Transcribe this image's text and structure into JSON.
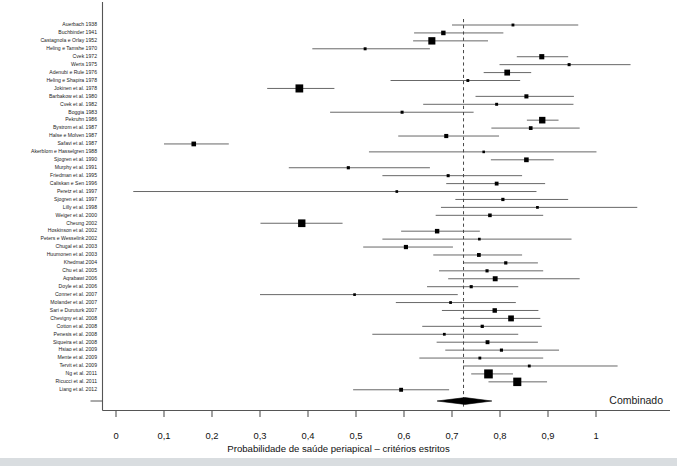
{
  "figure": {
    "type": "forest-plot",
    "axis_title": "Probabilidade de saúde periapical – critérios estritos",
    "combined_label": "Combinado",
    "colors": {
      "marker": "#000000",
      "line": "#4d4d4d",
      "axis": "#555555",
      "reference_line": "#333333",
      "text": "#1b1b1b",
      "background": "#ffffff",
      "page_band": "#d9dde0"
    }
  },
  "chart_data": {
    "type": "forest",
    "title": "",
    "xlabel": "Probabilidade de saúde periapical – critérios estritos",
    "ylabel": "",
    "xlim": [
      0,
      1.12
    ],
    "xticks": [
      0,
      0.1,
      0.2,
      0.3,
      0.4,
      0.5,
      0.6,
      0.7,
      0.8,
      0.9,
      1
    ],
    "xticklabels": [
      "0",
      "0,1",
      "0,2",
      "0,3",
      "0,4",
      "0,5",
      "0,6",
      "0,7",
      "0,8",
      "0,9",
      "1"
    ],
    "grid": false,
    "legend": false,
    "reference_line": 0.724,
    "effect_measure": "Probabilidade de saúde periapical",
    "summary": {
      "label": "Combinado",
      "estimate": 0.727,
      "ci_low": 0.669,
      "ci_high": 0.783,
      "shape": "diamond"
    },
    "studies": [
      {
        "label": "Auerbach 1938",
        "estimate": 0.827,
        "ci_low": 0.7,
        "ci_high": 0.963,
        "weight": 0.09
      },
      {
        "label": "Buchbinder 1941",
        "estimate": 0.682,
        "ci_low": 0.621,
        "ci_high": 0.807,
        "weight": 0.26
      },
      {
        "label": "Castagnola e Orlay 1952",
        "estimate": 0.658,
        "ci_low": 0.619,
        "ci_high": 0.775,
        "weight": 0.55
      },
      {
        "label": "Heling e Tamshe 1970",
        "estimate": 0.519,
        "ci_low": 0.409,
        "ci_high": 0.654,
        "weight": 0.1
      },
      {
        "label": "Cvek 1972",
        "estimate": 0.887,
        "ci_low": 0.835,
        "ci_high": 0.942,
        "weight": 0.33
      },
      {
        "label": "Werts 1975",
        "estimate": 0.944,
        "ci_low": 0.799,
        "ci_high": 1.072,
        "weight": 0.11
      },
      {
        "label": "Adenubi e Rule 1976",
        "estimate": 0.815,
        "ci_low": 0.766,
        "ci_high": 0.865,
        "weight": 0.4
      },
      {
        "label": "Heling e Shapira 1978",
        "estimate": 0.733,
        "ci_low": 0.572,
        "ci_high": 0.842,
        "weight": 0.09
      },
      {
        "label": "Jokinen et al. 1978",
        "estimate": 0.382,
        "ci_low": 0.315,
        "ci_high": 0.455,
        "weight": 0.62
      },
      {
        "label": "Barbakow et al. 1980",
        "estimate": 0.855,
        "ci_low": 0.749,
        "ci_high": 0.954,
        "weight": 0.22
      },
      {
        "label": "Cvek et al. 1982",
        "estimate": 0.793,
        "ci_low": 0.64,
        "ci_high": 0.953,
        "weight": 0.1
      },
      {
        "label": "Boggia 1983",
        "estimate": 0.596,
        "ci_low": 0.446,
        "ci_high": 0.745,
        "weight": 0.11
      },
      {
        "label": "Pekruhn 1986",
        "estimate": 0.888,
        "ci_low": 0.856,
        "ci_high": 0.922,
        "weight": 0.47
      },
      {
        "label": "Bystrom et al. 1987",
        "estimate": 0.864,
        "ci_low": 0.782,
        "ci_high": 0.966,
        "weight": 0.18
      },
      {
        "label": "Halse e Molven 1987",
        "estimate": 0.688,
        "ci_low": 0.588,
        "ci_high": 0.798,
        "weight": 0.22
      },
      {
        "label": "Safavi et al. 1987",
        "estimate": 0.162,
        "ci_low": 0.1,
        "ci_high": 0.235,
        "weight": 0.28
      },
      {
        "label": "Akerblom e Hasselgren 1988",
        "estimate": 0.766,
        "ci_low": 0.527,
        "ci_high": 1.001,
        "weight": 0.06
      },
      {
        "label": "Sjogren et al. 1990",
        "estimate": 0.855,
        "ci_low": 0.781,
        "ci_high": 0.912,
        "weight": 0.28
      },
      {
        "label": "Murphy et al. 1991",
        "estimate": 0.484,
        "ci_low": 0.36,
        "ci_high": 0.654,
        "weight": 0.12
      },
      {
        "label": "Friedman et al. 1995",
        "estimate": 0.692,
        "ci_low": 0.555,
        "ci_high": 0.846,
        "weight": 0.11
      },
      {
        "label": "Caliskan e Sen 1996",
        "estimate": 0.793,
        "ci_low": 0.688,
        "ci_high": 0.894,
        "weight": 0.19
      },
      {
        "label": "Peretz et al. 1997",
        "estimate": 0.585,
        "ci_low": 0.036,
        "ci_high": 0.876,
        "weight": 0.07
      },
      {
        "label": "Sjogren et al. 1997",
        "estimate": 0.806,
        "ci_low": 0.707,
        "ci_high": 0.942,
        "weight": 0.13
      },
      {
        "label": "Lilly et al. 1998",
        "estimate": 0.878,
        "ci_low": 0.677,
        "ci_high": 1.086,
        "weight": 0.08
      },
      {
        "label": "Weiger et al. 2000",
        "estimate": 0.779,
        "ci_low": 0.666,
        "ci_high": 0.89,
        "weight": 0.17
      },
      {
        "label": "Cheung 2002",
        "estimate": 0.387,
        "ci_low": 0.301,
        "ci_high": 0.472,
        "weight": 0.58
      },
      {
        "label": "Hoskinson et al. 2002",
        "estimate": 0.669,
        "ci_low": 0.594,
        "ci_high": 0.758,
        "weight": 0.26
      },
      {
        "label": "Peters e Wesselink 2002",
        "estimate": 0.757,
        "ci_low": 0.555,
        "ci_high": 0.949,
        "weight": 0.07
      },
      {
        "label": "Chugal et al. 2003",
        "estimate": 0.604,
        "ci_low": 0.515,
        "ci_high": 0.702,
        "weight": 0.23
      },
      {
        "label": "Huumonen et al. 2003",
        "estimate": 0.756,
        "ci_low": 0.661,
        "ci_high": 0.846,
        "weight": 0.19
      },
      {
        "label": "Khedmat 2004",
        "estimate": 0.812,
        "ci_low": 0.725,
        "ci_high": 0.879,
        "weight": 0.13
      },
      {
        "label": "Chu et al. 2005",
        "estimate": 0.773,
        "ci_low": 0.673,
        "ci_high": 0.89,
        "weight": 0.12
      },
      {
        "label": "Aqrabawi 2006",
        "estimate": 0.79,
        "ci_low": 0.692,
        "ci_high": 0.966,
        "weight": 0.31
      },
      {
        "label": "Doyle et al. 2006",
        "estimate": 0.74,
        "ci_low": 0.648,
        "ci_high": 0.838,
        "weight": 0.12
      },
      {
        "label": "Conner et al. 2007",
        "estimate": 0.497,
        "ci_low": 0.3,
        "ci_high": 0.712,
        "weight": 0.07
      },
      {
        "label": "Molander et al. 2007",
        "estimate": 0.697,
        "ci_low": 0.583,
        "ci_high": 0.833,
        "weight": 0.08
      },
      {
        "label": "Sari e Duruturk 2007",
        "estimate": 0.789,
        "ci_low": 0.679,
        "ci_high": 0.88,
        "weight": 0.26
      },
      {
        "label": "Chevigny et al. 2008",
        "estimate": 0.823,
        "ci_low": 0.718,
        "ci_high": 0.884,
        "weight": 0.4
      },
      {
        "label": "Cotton et al. 2008",
        "estimate": 0.763,
        "ci_low": 0.638,
        "ci_high": 0.887,
        "weight": 0.13
      },
      {
        "label": "Penesis et al. 2008",
        "estimate": 0.684,
        "ci_low": 0.534,
        "ci_high": 0.838,
        "weight": 0.08
      },
      {
        "label": "Siqueira et al. 2008",
        "estimate": 0.774,
        "ci_low": 0.668,
        "ci_high": 0.879,
        "weight": 0.2
      },
      {
        "label": "Hsiao et al. 2009",
        "estimate": 0.803,
        "ci_low": 0.686,
        "ci_high": 0.923,
        "weight": 0.12
      },
      {
        "label": "Mente et al. 2009",
        "estimate": 0.758,
        "ci_low": 0.632,
        "ci_high": 0.89,
        "weight": 0.09
      },
      {
        "label": "Tervit et al. 2009",
        "estimate": 0.861,
        "ci_low": 0.723,
        "ci_high": 1.045,
        "weight": 0.09
      },
      {
        "label": "Ng et al. 2011",
        "estimate": 0.776,
        "ci_low": 0.74,
        "ci_high": 0.827,
        "weight": 0.72
      },
      {
        "label": "Ricucci et al. 2011",
        "estimate": 0.836,
        "ci_low": 0.776,
        "ci_high": 0.898,
        "weight": 0.66
      },
      {
        "label": "Liang et al. 2012",
        "estimate": 0.594,
        "ci_low": 0.494,
        "ci_high": 0.694,
        "weight": 0.2
      }
    ]
  }
}
